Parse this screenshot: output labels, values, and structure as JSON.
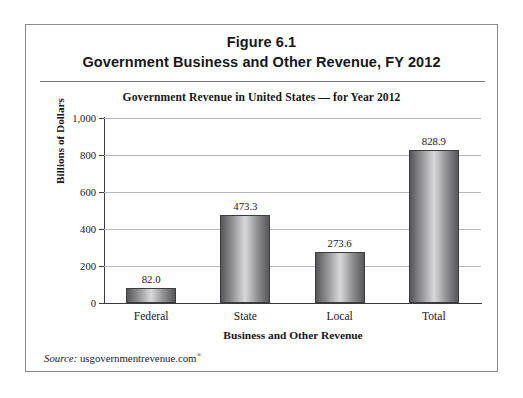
{
  "figure": {
    "title_line1": "Figure 6.1",
    "title_line2": "Government Business and Other Revenue, FY 2012",
    "source_label": "Source:",
    "source_text": "usgovernmentrevenue.com",
    "source_superscript": "®"
  },
  "chart_data": {
    "type": "bar",
    "title": "Government Revenue in United States  —  for Year 2012",
    "categories": [
      "Federal",
      "State",
      "Local",
      "Total"
    ],
    "values": [
      82.0,
      473.3,
      273.6,
      828.9
    ],
    "value_labels": [
      "82.0",
      "473.3",
      "273.6",
      "828.9"
    ],
    "xlabel": "Business and Other Revenue",
    "ylabel": "Billions of Dollars",
    "ylim": [
      0,
      1000
    ],
    "yticks": [
      0,
      200,
      400,
      600,
      800,
      1000
    ],
    "ytick_labels": [
      "0",
      "200",
      "400",
      "600",
      "800",
      "1,000"
    ],
    "grid": true,
    "legend": false,
    "bar_style": "cylinder-gradient-gray"
  },
  "colors": {
    "frame": "#8a8a8a",
    "rule": "#77777a",
    "axis": "#3b3b3e",
    "gridline": "#b9b9bc",
    "text": "#16171a",
    "bar_dark": "#575759",
    "bar_light": "#d8d8da",
    "background": "#ffffff"
  }
}
